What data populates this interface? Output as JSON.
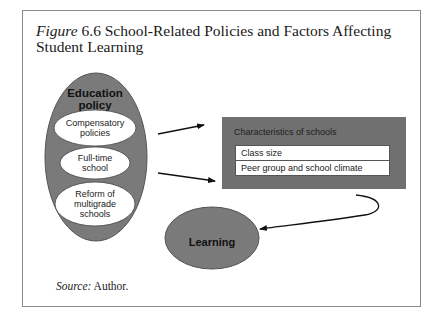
{
  "figure": {
    "label": "Figure",
    "number": "6.6",
    "title_line1": "School-Related Policies and Factors Affecting",
    "title_line2": "Student Learning"
  },
  "education_policy": {
    "heading_line1": "Education",
    "heading_line2": "policy",
    "items": [
      {
        "line1": "Compensatory",
        "line2": "policies",
        "line3": ""
      },
      {
        "line1": "Full-time",
        "line2": "school",
        "line3": ""
      },
      {
        "line1": "Reform of",
        "line2": "multigrade",
        "line3": "schools"
      }
    ]
  },
  "characteristics": {
    "heading": "Characteristics of schools",
    "rows": [
      "Class size",
      "Peer group and school climate"
    ]
  },
  "outcome": {
    "label": "Learning"
  },
  "source": {
    "label": "Source:",
    "value": "Author."
  },
  "colors": {
    "ellipse_fill": "#7a7a7a",
    "inner_ellipse_fill": "#ffffff",
    "box_fill": "#707070",
    "arrow": "#111111",
    "frame": "#8a8a8a"
  }
}
